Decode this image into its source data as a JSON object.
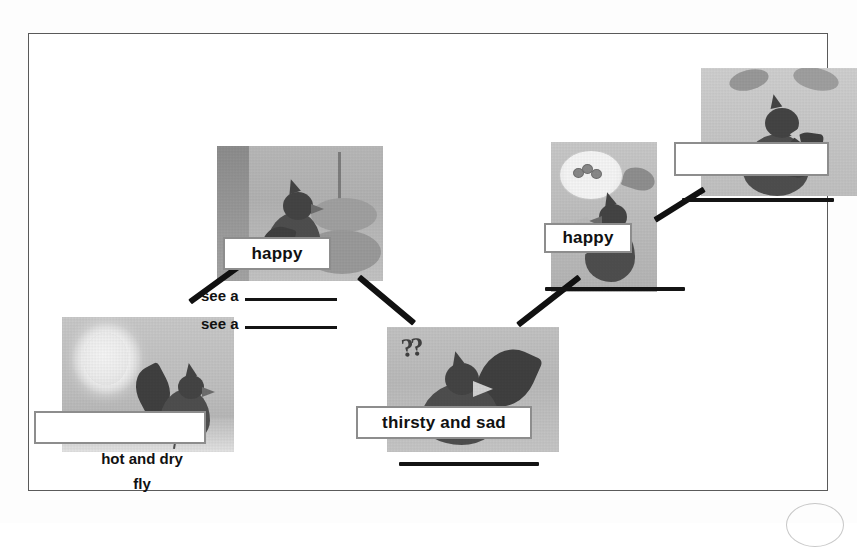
{
  "worksheet": {
    "title": "Story sequence map",
    "frame_color": "#5a5a5a"
  },
  "panels": [
    {
      "id": "panel-1",
      "name": "crow-hot-sun-panel",
      "description": "crow flying under a hot sun",
      "label": "",
      "captions": [
        "hot and dry",
        "fly"
      ]
    },
    {
      "id": "panel-2",
      "name": "crow-searching-panel",
      "description": "crow beside flowers and a fountain",
      "label": "happy",
      "captions": []
    },
    {
      "id": "panel-3",
      "name": "crow-thirsty-panel",
      "description": "crow with question marks looking confused",
      "label": "thirsty and sad",
      "captions": []
    },
    {
      "id": "panel-4",
      "name": "crow-idea-panel",
      "description": "crow thinking of pebbles in a thought bubble",
      "label": "happy",
      "captions": []
    },
    {
      "id": "panel-5",
      "name": "crow-drinking-panel",
      "description": "crow drinking from the pitcher",
      "label": "",
      "captions": []
    }
  ],
  "label_boxes": [
    {
      "name": "label-box-empty-bottom-left",
      "text": "",
      "empty": true
    },
    {
      "name": "label-box-happy-left",
      "text": "happy",
      "empty": false
    },
    {
      "name": "label-box-thirsty-and-sad",
      "text": "thirsty and sad",
      "empty": false
    },
    {
      "name": "label-box-happy-right",
      "text": "happy",
      "empty": false
    },
    {
      "name": "label-box-empty-top-right",
      "text": "",
      "empty": true
    }
  ],
  "prompts": [
    {
      "name": "see-a-prompt-1",
      "text": "see a"
    },
    {
      "name": "see-a-prompt-2",
      "text": "see a"
    }
  ],
  "blank_lines": [
    {
      "name": "blank-line-under-panel-3"
    },
    {
      "name": "blank-line-under-panel-4"
    },
    {
      "name": "blank-line-under-panel-5"
    }
  ],
  "colors": {
    "ink": "#141414",
    "box_border": "#8d8d8d",
    "frame": "#5a5a5a",
    "connector": "#111111"
  }
}
